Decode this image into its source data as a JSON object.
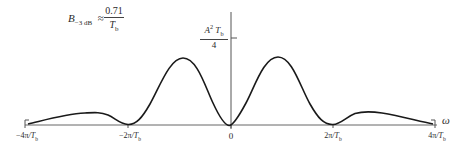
{
  "diagram": {
    "type": "power-spectral-density-plot",
    "bandwidth_annotation": {
      "lhs_symbol": "B",
      "lhs_subscript": "−3 dB",
      "relation": "≈",
      "numerator": "0.71",
      "denominator_symbol": "T",
      "denominator_subscript": "b"
    },
    "y_peak_label": {
      "numerator_symbol": "A",
      "numerator_superscript": "2",
      "numerator_symbol2": "T",
      "numerator_subscript": "b",
      "denominator": "4"
    },
    "x_axis": {
      "variable": "ω",
      "ticks": [
        {
          "label_num": "−4π",
          "label_den": "T",
          "label_sub": "b"
        },
        {
          "label_num": "−2π",
          "label_den": "T",
          "label_sub": "b"
        },
        {
          "label_num": "0",
          "label_den": "",
          "label_sub": ""
        },
        {
          "label_num": "2π",
          "label_den": "T",
          "label_sub": "b"
        },
        {
          "label_num": "4π",
          "label_den": "T",
          "label_sub": "b"
        }
      ]
    },
    "colors": {
      "curve": "#1a1a1a",
      "axis": "#555555",
      "background": "#ffffff"
    }
  }
}
